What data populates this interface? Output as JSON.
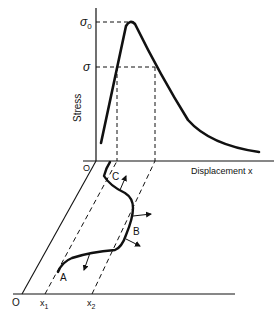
{
  "diagram": {
    "upper_plot": {
      "y_axis_label": "Stress",
      "x_axis_label": "Displacement x",
      "origin_label": "O",
      "y_ticks": [
        {
          "label": "σ",
          "sub": "0"
        },
        {
          "label": "σ",
          "sub": ""
        }
      ]
    },
    "lower_plot": {
      "origin_label": "O",
      "x_ticks": [
        {
          "label": "x",
          "sub": "1"
        },
        {
          "label": "x",
          "sub": "2"
        }
      ],
      "curve_points": [
        "A",
        "B",
        "C"
      ]
    },
    "colors": {
      "line": "#111111",
      "background": "#ffffff"
    }
  }
}
